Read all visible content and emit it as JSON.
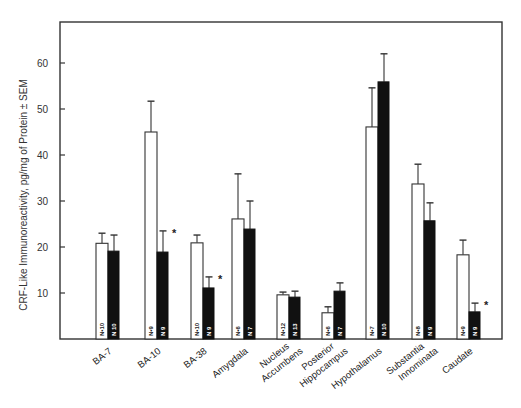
{
  "chart_data": {
    "type": "bar",
    "title": "",
    "xlabel": "",
    "ylabel": "CRF-Like Immunoreactivity, pg/mg of Protein ± SEM",
    "ylim": [
      0,
      68
    ],
    "yticks": [
      10,
      20,
      30,
      40,
      50,
      60
    ],
    "grid": false,
    "legend": null,
    "categories": [
      "BA-7",
      "BA-10",
      "BA-38",
      "Amygdala",
      "Nucleus Accumbens",
      "Posterior Hippocampus",
      "Hypothalamus",
      "Substantia Innominata",
      "Caudate"
    ],
    "category_label_lines": [
      [
        "BA-7"
      ],
      [
        "BA-10"
      ],
      [
        "BA-38"
      ],
      [
        "Amygdala"
      ],
      [
        "Nucleus",
        "Accumbens"
      ],
      [
        "Posterior",
        "Hippocampus"
      ],
      [
        "Hypothalamus"
      ],
      [
        "Substantia",
        "Innominata"
      ],
      [
        "Caudate"
      ]
    ],
    "series": [
      {
        "name": "Control (open bars)",
        "color": "#ffffff",
        "values": [
          20.8,
          45.0,
          20.9,
          26.1,
          9.6,
          5.7,
          46.1,
          33.7,
          18.3
        ],
        "sem_upper": [
          23.0,
          51.7,
          22.6,
          35.9,
          10.2,
          7.0,
          54.6,
          38.0,
          21.5
        ],
        "n": [
          "N=10",
          "N=9",
          "N=10",
          "N=6",
          "N=12",
          "N=6",
          "N=7",
          "N=8",
          "N=9"
        ]
      },
      {
        "name": "Patient (filled bars)",
        "color": "#111111",
        "values": [
          19.1,
          18.9,
          11.1,
          23.9,
          9.1,
          10.4,
          55.9,
          25.7,
          5.9
        ],
        "sem_upper": [
          22.6,
          23.5,
          13.5,
          30.0,
          10.4,
          12.2,
          62.0,
          29.6,
          7.8
        ],
        "n": [
          "N=10",
          "N=9",
          "N=9",
          "N=7",
          "N=13",
          "N=7",
          "N=10",
          "N=9",
          "N=9"
        ],
        "significant": [
          false,
          true,
          true,
          false,
          false,
          false,
          false,
          false,
          true
        ]
      }
    ],
    "annotations": [
      "* significant difference marker next to BA-10, BA-38 and Caudate filled bars"
    ]
  },
  "significance_marker": "*"
}
